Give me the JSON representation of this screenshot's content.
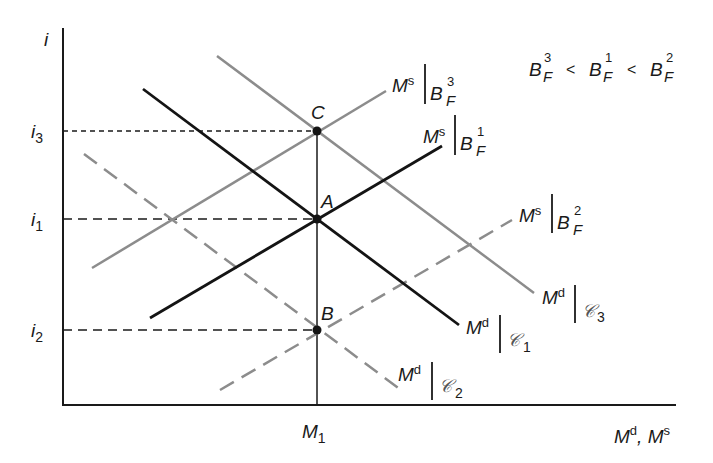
{
  "diagram": {
    "axes": {
      "y_label": "i",
      "x_label": "M^d, M^s",
      "x_label_parts": {
        "m1": "M",
        "sup1": "d",
        "sep": ", ",
        "m2": "M",
        "sup2": "s"
      }
    },
    "y_ticks": [
      {
        "id": "i3",
        "base": "i",
        "sub": "3",
        "y": 131
      },
      {
        "id": "i1",
        "base": "i",
        "sub": "1",
        "y": 219
      },
      {
        "id": "i2",
        "base": "i",
        "sub": "2",
        "y": 330
      }
    ],
    "x_ticks": [
      {
        "id": "M1",
        "base": "M",
        "sub": "1",
        "x": 317
      }
    ],
    "points": [
      {
        "label": "C",
        "x": 317,
        "y": 131
      },
      {
        "label": "A",
        "x": 317,
        "y": 219
      },
      {
        "label": "B",
        "x": 317,
        "y": 330
      }
    ],
    "curves": [
      {
        "id": "Ms_BF3",
        "kind": "supply",
        "style": "gray-solid",
        "base": "M",
        "sup": "s",
        "cond": "B",
        "cond_sup": "3",
        "cond_sub": "F",
        "x1": 92,
        "y1": 268,
        "x2": 386,
        "y2": 91
      },
      {
        "id": "Ms_BF1",
        "kind": "supply",
        "style": "black-solid",
        "base": "M",
        "sup": "s",
        "cond": "B",
        "cond_sup": "1",
        "cond_sub": "F",
        "x1": 150,
        "y1": 318,
        "x2": 442,
        "y2": 146
      },
      {
        "id": "Ms_BF2",
        "kind": "supply",
        "style": "gray-dashed",
        "base": "M",
        "sup": "s",
        "cond": "B",
        "cond_sup": "2",
        "cond_sub": "F",
        "x1": 220,
        "y1": 390,
        "x2": 512,
        "y2": 220
      },
      {
        "id": "Md_C3",
        "kind": "demand",
        "style": "gray-solid",
        "base": "M",
        "sup": "d",
        "cond": "𝒞",
        "cond_sub": "3",
        "x1": 217,
        "y1": 56,
        "x2": 534,
        "y2": 293
      },
      {
        "id": "Md_C1",
        "kind": "demand",
        "style": "black-solid",
        "base": "M",
        "sup": "d",
        "cond": "𝒞",
        "cond_sub": "1",
        "x1": 143,
        "y1": 89,
        "x2": 459,
        "y2": 325
      },
      {
        "id": "Md_C2",
        "kind": "demand",
        "style": "gray-dashed",
        "base": "M",
        "sup": "d",
        "cond": "𝒞",
        "cond_sub": "2",
        "x1": 84,
        "y1": 154,
        "x2": 401,
        "y2": 390
      }
    ],
    "inequality": {
      "text": "B_F^3 < B_F^1 < B_F^2",
      "terms": [
        {
          "base": "B",
          "sup": "3",
          "sub": "F"
        },
        {
          "base": "B",
          "sup": "1",
          "sub": "F"
        },
        {
          "base": "B",
          "sup": "2",
          "sub": "F"
        }
      ],
      "op": "<"
    },
    "colors": {
      "black": "#141414",
      "gray": "#8c8c8c",
      "axis": "#1a1a1a",
      "background": "#ffffff"
    }
  }
}
